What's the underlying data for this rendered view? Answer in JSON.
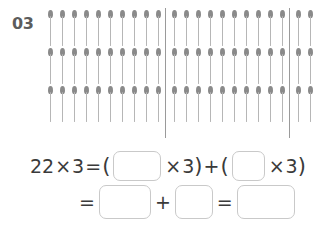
{
  "problem": {
    "number": "03"
  },
  "diagram": {
    "type": "matchstick-array",
    "rows": 3,
    "matchsticks_per_row": 22,
    "group_sizes": [
      10,
      10,
      2
    ],
    "total_matchsticks": 66,
    "divider_count": 2,
    "matchstick_color": "#8a8a8a",
    "stem_color": "#b6b6b6",
    "divider_color": "#9a9a9a"
  },
  "equations": {
    "line1": {
      "left_operand": "22",
      "times_1": "×",
      "right_operand": "3",
      "equals": "=",
      "open_paren_1": "(",
      "blank_1": "",
      "times_2": "×",
      "factor_1": "3",
      "close_paren_1": ")",
      "plus": "+",
      "open_paren_2": "(",
      "blank_2": "",
      "times_3": "×",
      "factor_2": "3",
      "close_paren_2": ")"
    },
    "line2": {
      "equals_1": "=",
      "blank_3": "",
      "plus": "+",
      "blank_4": "",
      "equals_2": "=",
      "blank_5": ""
    }
  },
  "colors": {
    "text": "#3a3a3a",
    "number_label": "#5c5c5c",
    "box_border": "#c9c9c9",
    "background": "#ffffff"
  }
}
